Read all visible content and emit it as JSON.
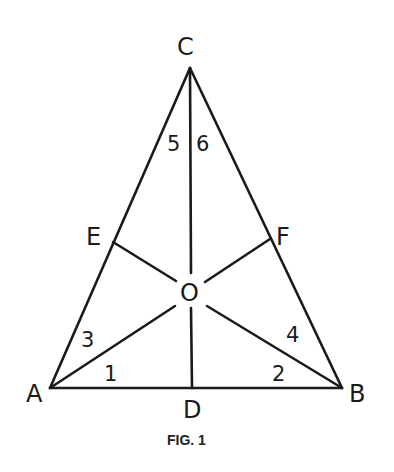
{
  "figure": {
    "caption": "FIG. 1",
    "vertices": {
      "A": "A",
      "B": "B",
      "C": "C"
    },
    "points": {
      "D": "D",
      "E": "E",
      "F": "F",
      "O": "O"
    },
    "angles": [
      "1",
      "2",
      "3",
      "4",
      "5",
      "6"
    ],
    "segments": [
      "AB",
      "BC",
      "CA",
      "CD",
      "AF",
      "BE"
    ]
  }
}
